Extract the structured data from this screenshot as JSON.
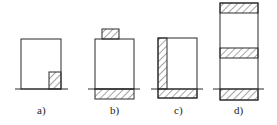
{
  "diagram": {
    "stroke_color": "#2a2a2a",
    "hatch_color": "#3a3a3a",
    "background": "#ffffff",
    "panels": [
      {
        "id": "a",
        "label": "a)",
        "description": "block with small hatched support at bottom-right corner on ground line"
      },
      {
        "id": "b",
        "label": "b)",
        "description": "block with small hatched cap on top and hatched base below ground line"
      },
      {
        "id": "c",
        "label": "c)",
        "description": "block with hatched left wall and hatched base below ground line"
      },
      {
        "id": "d",
        "label": "d)",
        "description": "tall column with hatched top, middle, and base bands; ground line through base"
      }
    ]
  }
}
